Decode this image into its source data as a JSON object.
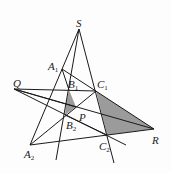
{
  "figure": {
    "type": "projective-geometry-diagram",
    "colors": {
      "line": "#1a1a1a",
      "shade": "#8a8a8a",
      "background": "#fdfdfd"
    },
    "points": {
      "S": {
        "label": "S",
        "x": 79,
        "y": 29
      },
      "A1": {
        "label": "A",
        "sub": "1",
        "x": 62,
        "y": 69
      },
      "B1": {
        "label": "B",
        "sub": "1",
        "x": 69,
        "y": 90
      },
      "C1": {
        "label": "C",
        "sub": "1",
        "x": 96,
        "y": 91
      },
      "Q": {
        "label": "Q",
        "x": 14,
        "y": 89
      },
      "P": {
        "label": "P",
        "x": 76,
        "y": 107
      },
      "B2": {
        "label": "B",
        "sub": "2",
        "x": 65,
        "y": 115
      },
      "A2": {
        "label": "A",
        "sub": "2",
        "x": 30,
        "y": 145
      },
      "C2": {
        "label": "C",
        "sub": "2",
        "x": 107,
        "y": 135
      },
      "R": {
        "label": "R",
        "x": 154,
        "y": 129
      }
    },
    "labels": [
      "S",
      "A1",
      "B1",
      "C1",
      "Q",
      "P",
      "B2",
      "A2",
      "C2",
      "R"
    ]
  }
}
